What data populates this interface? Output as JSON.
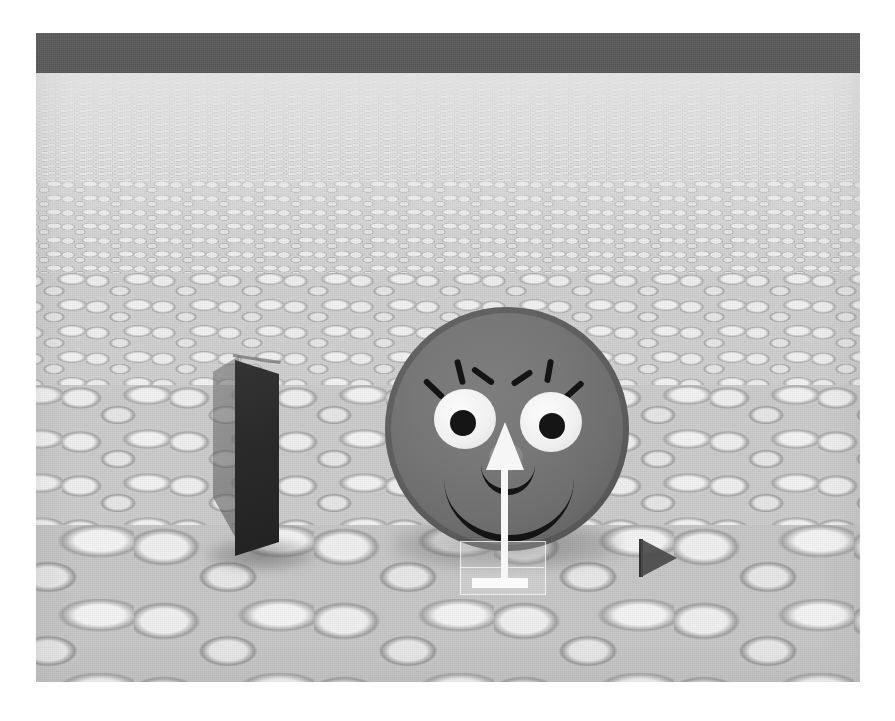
{
  "scene": {
    "title": "3D simulation viewport",
    "renderer": "rasterized cobblestone ground plane with agent sphere",
    "viewport": {
      "x": 36,
      "y": 33,
      "width": 824,
      "height": 649,
      "background_color": "#c9c9c9"
    },
    "page_background_color": "#ffffff"
  },
  "sky": {
    "name": "back wall band",
    "color": "#5a5a5a",
    "height_px": 41
  },
  "ground": {
    "name": "cobblestone floor",
    "material": "rounded pebble cobblestone",
    "near_color": "#c6c6c6",
    "far_color": "#d8d8d8",
    "horizon_y": 73,
    "layers": [
      {
        "id": "cob-far",
        "label": "far cobbles"
      },
      {
        "id": "cob-mid1",
        "label": "mid cobbles near"
      },
      {
        "id": "cob-mid2",
        "label": "mid cobbles far"
      },
      {
        "id": "cob-near1",
        "label": "near cobbles"
      },
      {
        "id": "cob-near2",
        "label": "foreground cobbles"
      }
    ]
  },
  "objects": {
    "agent": {
      "name": "smiley face sphere agent",
      "body_color": "#757575",
      "rim_color": "#4f4f4f",
      "diameter_px": 244,
      "center": {
        "x": 471,
        "y": 396
      },
      "features": {
        "eye_color": "#f2f2f2",
        "pupil_color": "#151515",
        "lash_color": "#141414",
        "lash_count_per_eye": 3,
        "nose_color": "#8a8a8a",
        "mouth_color": "#141414",
        "expression": "smiling"
      }
    },
    "slab": {
      "name": "dark rectangular slab obstacle",
      "front_color": "#2a2a2a",
      "side_color": "#5a5a5a",
      "position": {
        "x": 173,
        "y": 315
      },
      "width_px": 84,
      "height_px": 215
    },
    "triangle": {
      "name": "small triangular marker",
      "color": "#4a4a4a",
      "direction": "right",
      "position": {
        "x": 605,
        "y": 506
      },
      "size_px": 38
    },
    "arrow": {
      "name": "heading direction arrow gizmo",
      "color": "#f7f7f7",
      "direction": "up",
      "position": {
        "x": 441,
        "y": 389
      },
      "height_px": 178
    },
    "gizmo_box": {
      "name": "translucent selection box",
      "stroke_color": "#ffffff",
      "fill_opacity": "0.16",
      "position": {
        "x": 424,
        "y": 508
      },
      "width_px": 84,
      "height_px": 52
    }
  }
}
